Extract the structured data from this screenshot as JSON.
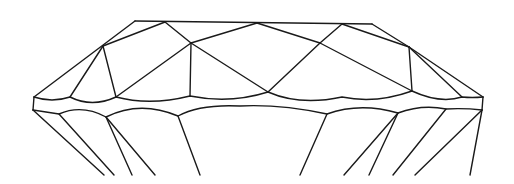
{
  "diagram": {
    "stroke_color": "#1a1a1a",
    "background": "#ffffff",
    "lines": [
      [
        135,
        21,
        372,
        24
      ],
      [
        135,
        21,
        34,
        97
      ],
      [
        372,
        24,
        409,
        47
      ],
      [
        409,
        47,
        483,
        97
      ],
      [
        165,
        22,
        103,
        46
      ],
      [
        165,
        22,
        191,
        43
      ],
      [
        191,
        43,
        257,
        23
      ],
      [
        257,
        23,
        320,
        43
      ],
      [
        320,
        43,
        342,
        24
      ],
      [
        342,
        24,
        409,
        47
      ],
      [
        103,
        46,
        70,
        97
      ],
      [
        103,
        46,
        116,
        97
      ],
      [
        191,
        43,
        116,
        97
      ],
      [
        191,
        43,
        190,
        96
      ],
      [
        191,
        43,
        268,
        92
      ],
      [
        320,
        43,
        268,
        92
      ],
      [
        320,
        43,
        412,
        91
      ],
      [
        409,
        47,
        412,
        91
      ],
      [
        409,
        47,
        462,
        97
      ],
      [
        34,
        97,
        33,
        110
      ],
      [
        483,
        97,
        482,
        110
      ],
      [
        33,
        110,
        104,
        175
      ],
      [
        59,
        114,
        114,
        175
      ],
      [
        106,
        117,
        132,
        175
      ],
      [
        106,
        117,
        155,
        175
      ],
      [
        178,
        116,
        200,
        175
      ],
      [
        327,
        114,
        300,
        175
      ],
      [
        398,
        113,
        344,
        175
      ],
      [
        398,
        113,
        369,
        175
      ],
      [
        446,
        109,
        393,
        175
      ],
      [
        482,
        110,
        415,
        175
      ],
      [
        470,
        175,
        482,
        110
      ]
    ],
    "curves": [
      "M34,97 Q52,103 70,97 Q92,108 116,97 Q150,106 190,96 Q230,104 268,92 Q300,106 342,97 Q376,104 412,91 Q440,104 462,97 Q472,98 483,97",
      "M33,110 Q46,112 59,114 Q82,104 106,117 Q140,100 178,116 Q200,104 240,106 Q280,104 327,114 Q360,102 398,113 Q422,104 446,109 Q464,108 482,110"
    ]
  }
}
